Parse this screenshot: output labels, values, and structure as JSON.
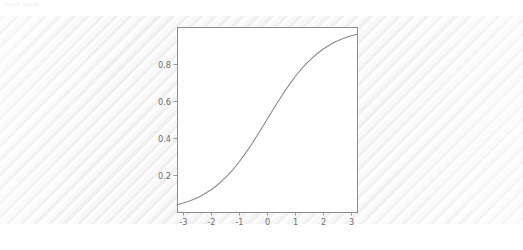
{
  "page": {
    "header_text": "lorem ipsum",
    "background_color": "#ffffff",
    "card_color": "#f7f7f7"
  },
  "chart_data": {
    "type": "line",
    "title": "",
    "subtitle": "",
    "xlabel": "",
    "ylabel": "",
    "xlim": [
      -3.2,
      3.2
    ],
    "ylim": [
      0.0,
      1.0
    ],
    "xticks": [
      -3,
      -2,
      -1,
      0,
      1,
      2,
      3
    ],
    "xticklabels": [
      "-3",
      "-2",
      "-1",
      "0",
      "1",
      "2",
      "3"
    ],
    "yticks": [
      0.2,
      0.4,
      0.6,
      0.8
    ],
    "yticklabels": [
      "0.2",
      "0.4",
      "0.6",
      "0.8"
    ],
    "grid": true,
    "legend": null,
    "legend_position": "none",
    "line_color": "#8a8a8a",
    "grid_color": "#c9c9c9",
    "frame_color": "#8d8d8d",
    "series": [
      {
        "name": "sigmoid",
        "x": [
          -3.2,
          -3.0,
          -2.8,
          -2.6,
          -2.4,
          -2.2,
          -2.0,
          -1.8,
          -1.6,
          -1.4,
          -1.2,
          -1.0,
          -0.8,
          -0.6,
          -0.4,
          -0.2,
          0.0,
          0.2,
          0.4,
          0.6,
          0.8,
          1.0,
          1.2,
          1.4,
          1.6,
          1.8,
          2.0,
          2.2,
          2.4,
          2.6,
          2.8,
          3.0,
          3.2
        ],
        "y": [
          0.039,
          0.047,
          0.057,
          0.069,
          0.083,
          0.1,
          0.119,
          0.142,
          0.168,
          0.198,
          0.231,
          0.269,
          0.31,
          0.354,
          0.401,
          0.45,
          0.5,
          0.55,
          0.599,
          0.646,
          0.69,
          0.731,
          0.769,
          0.802,
          0.832,
          0.858,
          0.881,
          0.9,
          0.917,
          0.931,
          0.943,
          0.953,
          0.961
        ]
      }
    ]
  }
}
